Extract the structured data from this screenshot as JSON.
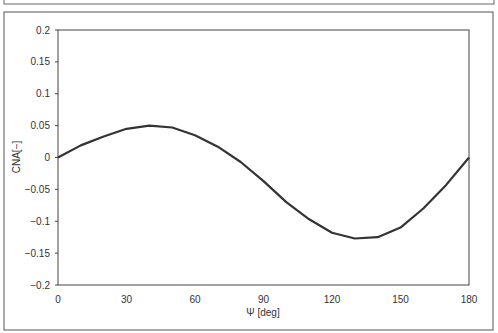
{
  "chart_data": {
    "type": "line",
    "title": "",
    "xlabel": "Ψ [deg]",
    "ylabel": "CNA[−]",
    "x": [
      0,
      10,
      20,
      30,
      40,
      50,
      60,
      70,
      80,
      90,
      100,
      110,
      120,
      130,
      140,
      150,
      160,
      170,
      180
    ],
    "series": [
      {
        "name": "CNA",
        "values": [
          0,
          0.019,
          0.033,
          0.045,
          0.05,
          0.047,
          0.035,
          0.017,
          -0.007,
          -0.037,
          -0.07,
          -0.097,
          -0.118,
          -0.127,
          -0.125,
          -0.11,
          -0.08,
          -0.043,
          0
        ]
      }
    ],
    "xticks": [
      "0",
      "30",
      "60",
      "90",
      "120",
      "150",
      "180"
    ],
    "yticks": [
      "0.2",
      "0.15",
      "0.1",
      "0.05",
      "0",
      "-0.05",
      "-0.1",
      "-0.15",
      "-0.2"
    ],
    "xlim": [
      0,
      180
    ],
    "ylim": [
      -0.2,
      0.2
    ],
    "grid": false,
    "legend": "none"
  }
}
